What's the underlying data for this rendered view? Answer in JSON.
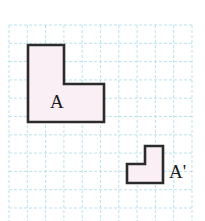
{
  "figure": {
    "canvas": {
      "width": 205,
      "height": 221,
      "background": "#ffffff"
    },
    "grid": {
      "name": "graph-paper-grid",
      "line_color": "#b9e3ef",
      "line_style": "dashed",
      "cell_size": 18.3,
      "origin_x": 9,
      "origin_y": 25,
      "cols": 10,
      "rows": 11
    },
    "shapes": [
      {
        "id": "shape-a",
        "label": "A",
        "label_x": 50,
        "label_y": 108,
        "label_size": 19,
        "outline_color": "#2b2b2b",
        "fill_color": "#f9eff4",
        "stroke_width": 2.6,
        "points": "28,45 64,45 64,84 104,84 104,122 28,122"
      },
      {
        "id": "shape-a-prime",
        "label": "A'",
        "label_x": 169,
        "label_y": 178,
        "label_size": 19,
        "outline_color": "#2b2b2b",
        "fill_color": "#f9eff4",
        "stroke_width": 2.6,
        "points": "145,146 163,146 163,183 127,183 127,164 145,164"
      }
    ]
  }
}
